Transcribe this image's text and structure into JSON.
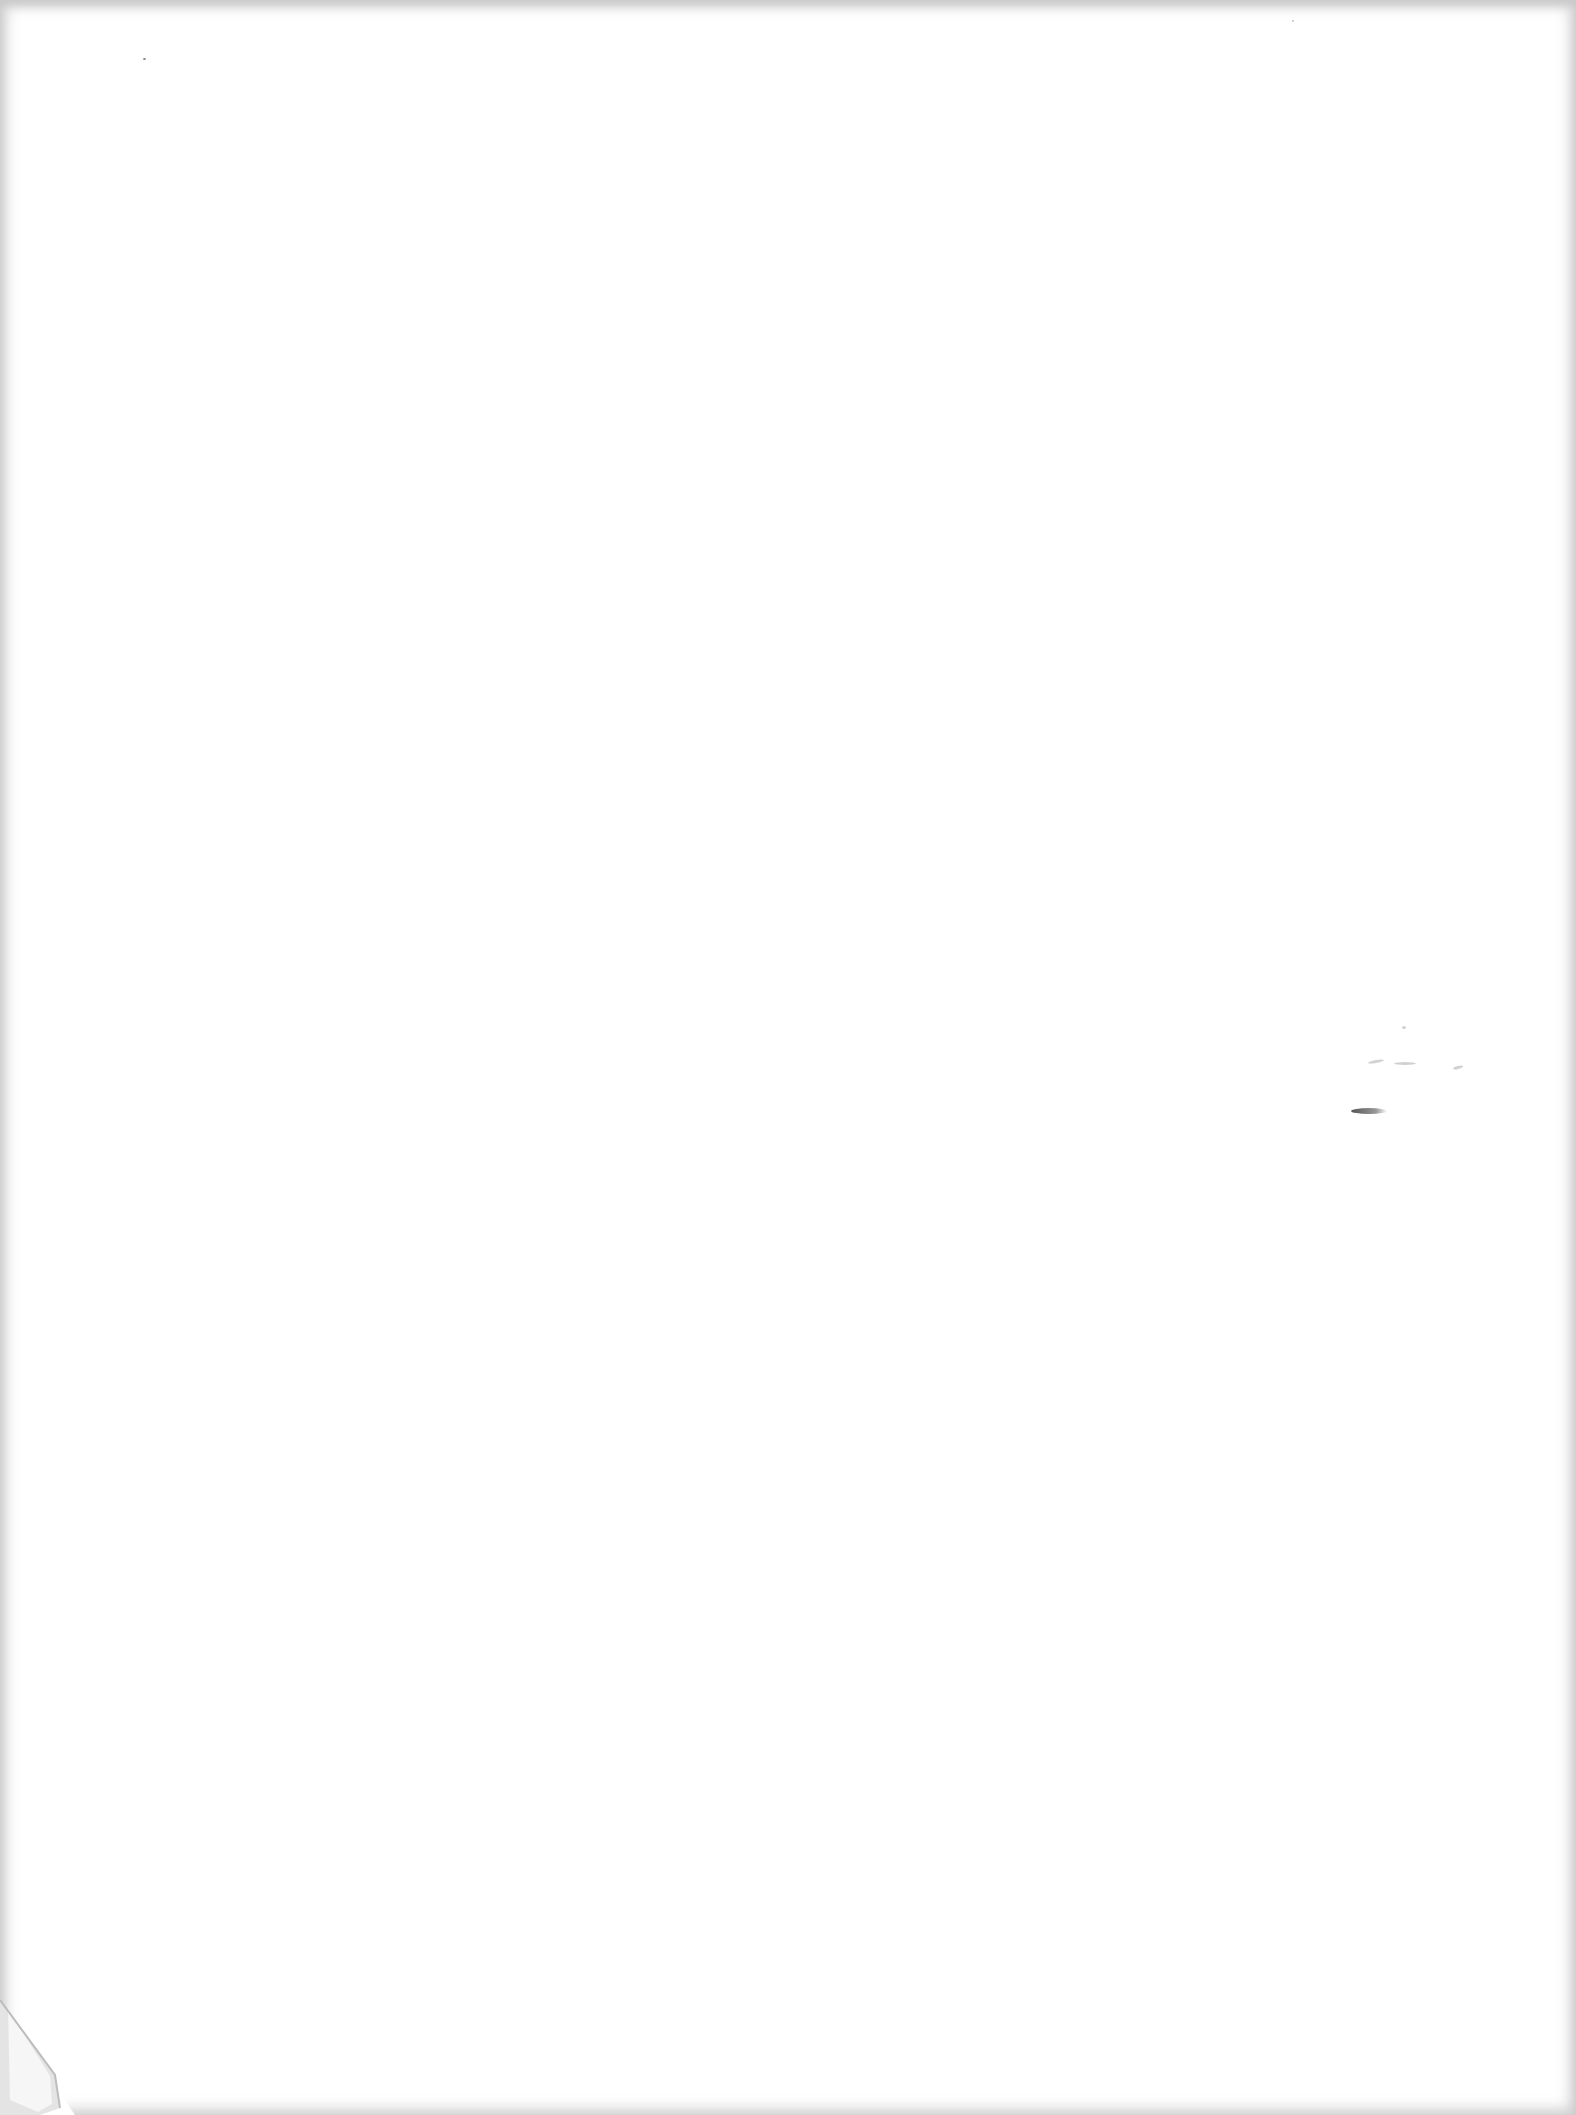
{
  "document": {
    "type": "scanned-page",
    "content": "",
    "text_lines": []
  },
  "colors": {
    "paper": "#ffffff",
    "edge_shadow": "#d0d0d0",
    "mark": "#555555"
  }
}
